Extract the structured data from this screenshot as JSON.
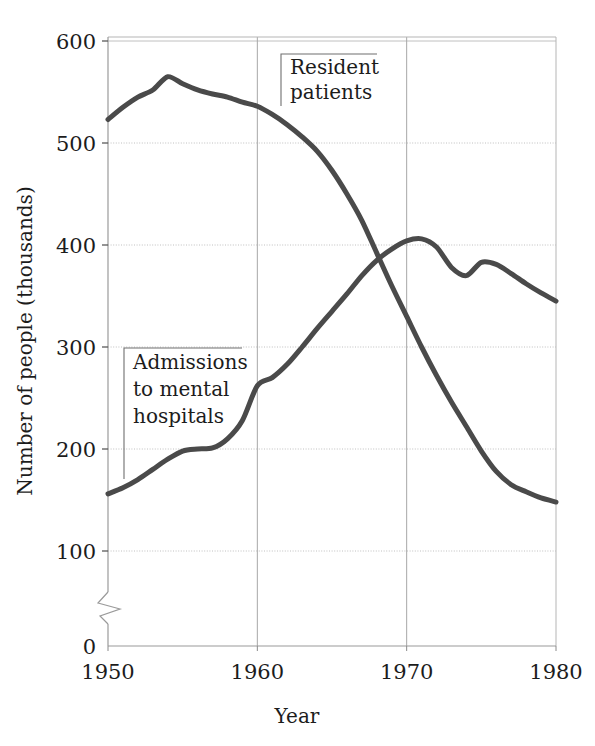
{
  "chart_data": {
    "type": "line",
    "title": "",
    "xlabel": "Year",
    "ylabel": "Number of people (thousands)",
    "xlim": [
      1950,
      1980
    ],
    "ylim": [
      0,
      600
    ],
    "y_axis_break": true,
    "grid": true,
    "legend_position": "inline-annotations",
    "xticks": [
      "1950",
      "1960",
      "1970",
      "1980"
    ],
    "xtick_values": [
      1950,
      1960,
      1970,
      1980
    ],
    "yticks": [
      "0",
      "100",
      "200",
      "300",
      "400",
      "500",
      "600"
    ],
    "ytick_values": [
      0,
      100,
      200,
      300,
      400,
      500,
      600
    ],
    "line_color": "#4a4a4a",
    "grid_color": "#b9b9b9",
    "axis_color": "#9a9a9a",
    "series": [
      {
        "name": "Resident patients",
        "label_lines": [
          "Resident",
          "patients"
        ],
        "x": [
          1950,
          1951,
          1952,
          1953,
          1954,
          1955,
          1956,
          1957,
          1958,
          1959,
          1960,
          1961,
          1962,
          1963,
          1964,
          1965,
          1966,
          1967,
          1968,
          1969,
          1970,
          1971,
          1972,
          1973,
          1974,
          1975,
          1976,
          1977,
          1978,
          1979,
          1980
        ],
        "values": [
          523,
          535,
          545,
          552,
          565,
          558,
          552,
          548,
          545,
          540,
          536,
          528,
          518,
          506,
          492,
          473,
          450,
          424,
          392,
          360,
          330,
          300,
          272,
          246,
          222,
          198,
          178,
          165,
          158,
          152,
          148
        ]
      },
      {
        "name": "Admissions to mental hospitals",
        "label_lines": [
          "Admissions",
          "to mental",
          "hospitals"
        ],
        "x": [
          1950,
          1951,
          1952,
          1953,
          1954,
          1955,
          1956,
          1957,
          1958,
          1959,
          1960,
          1961,
          1962,
          1963,
          1964,
          1965,
          1966,
          1967,
          1968,
          1969,
          1970,
          1971,
          1972,
          1973,
          1974,
          1975,
          1976,
          1977,
          1978,
          1979,
          1980
        ],
        "values": [
          156,
          162,
          170,
          180,
          190,
          198,
          200,
          201,
          210,
          228,
          262,
          270,
          283,
          300,
          318,
          335,
          352,
          370,
          385,
          396,
          404,
          406,
          398,
          378,
          370,
          383,
          381,
          372,
          362,
          353,
          345
        ]
      }
    ],
    "annotations": [
      {
        "text": "Resident patients",
        "series": "Resident patients"
      },
      {
        "text": "Admissions to mental hospitals",
        "series": "Admissions to mental hospitals"
      }
    ]
  }
}
